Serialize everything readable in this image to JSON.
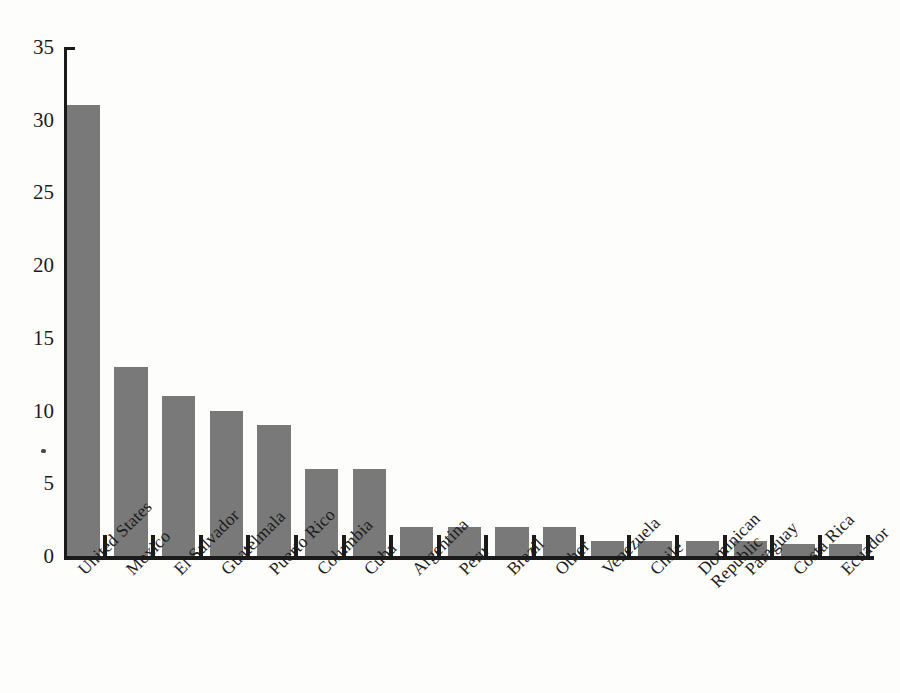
{
  "chart_data": {
    "type": "bar",
    "title": "",
    "subtitle": "",
    "xlabel": "",
    "ylabel": "",
    "ylim": [
      0,
      35
    ],
    "yticks": [
      0,
      5,
      10,
      15,
      20,
      25,
      30,
      35
    ],
    "ytick_labels": [
      "0",
      "5",
      "10",
      "15",
      "20",
      "25",
      "30",
      "35"
    ],
    "grid": false,
    "legend": null,
    "bar_color": "#797979",
    "axis_color": "#1a1a1a",
    "background_color": "#fdfdfc",
    "categories": [
      "United States",
      "Mexico",
      "El Salvador",
      "Guatelmala",
      "Puerto Rico",
      "Columbia",
      "Cuba",
      "Argentina",
      "Peru",
      "Brazil",
      "Other",
      "Venezuela",
      "Chile",
      "Dominican Republic",
      "Paraguay",
      "Costa Rica",
      "Ecuador"
    ],
    "category_lines": [
      [
        "United States"
      ],
      [
        "Mexico"
      ],
      [
        "El Salvador"
      ],
      [
        "Guatelmala"
      ],
      [
        "Puerto Rico"
      ],
      [
        "Columbia"
      ],
      [
        "Cuba"
      ],
      [
        "Argentina"
      ],
      [
        "Peru"
      ],
      [
        "Brazil"
      ],
      [
        "Other"
      ],
      [
        "Venezuela"
      ],
      [
        "Chile"
      ],
      [
        "Dominican",
        "Republic"
      ],
      [
        "Paraguay"
      ],
      [
        "Costa Rica"
      ],
      [
        "Ecuador"
      ]
    ],
    "values": [
      31,
      13,
      11,
      10,
      9,
      6,
      6,
      2,
      2,
      2,
      2,
      1,
      1,
      1,
      1,
      0.8,
      0.8
    ]
  }
}
